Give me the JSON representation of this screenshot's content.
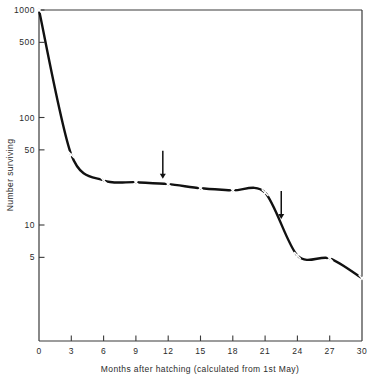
{
  "chart_data": {
    "type": "line",
    "title": "",
    "xlabel": "Months after hatching (calculated from 1st May)",
    "ylabel": "Number surviving",
    "yscale": "log",
    "xlim": [
      0,
      30
    ],
    "ylim": [
      2,
      1000
    ],
    "grid": false,
    "legend": "none",
    "marker": "x",
    "xticks": [
      "0",
      "3",
      "6",
      "9",
      "12",
      "15",
      "18",
      "21",
      "24",
      "27",
      "30"
    ],
    "xtick_values": [
      0,
      3,
      6,
      9,
      12,
      15,
      18,
      21,
      24,
      27,
      30
    ],
    "yticks": [
      "1000",
      "500",
      "100",
      "50",
      "10",
      "5"
    ],
    "ytick_values": [
      1000,
      500,
      100,
      50,
      10,
      5
    ],
    "series": [
      {
        "name": "Number surviving",
        "x": [
          0,
          3,
          6,
          9,
          12,
          15,
          18,
          21,
          24,
          27,
          30
        ],
        "values": [
          1000,
          45,
          26,
          25,
          24,
          22,
          21,
          20,
          5.2,
          4.9,
          3.2
        ]
      }
    ],
    "annotations": [
      {
        "type": "arrow",
        "direction": "down",
        "x": 11.5,
        "label": ""
      },
      {
        "type": "arrow",
        "direction": "down",
        "x": 22.5,
        "label": ""
      }
    ]
  },
  "colors": {
    "axis": "#3a3a3a",
    "curve": "#111111",
    "marker": "#ffffff",
    "text": "#2b2b2b",
    "background": "#ffffff"
  }
}
